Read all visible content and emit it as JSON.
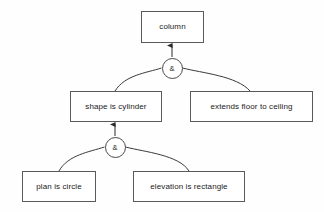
{
  "diagram": {
    "colors": {
      "background": "#fefefe",
      "box_fill": "#ffffff",
      "box_border": "#5a5a5a",
      "edge": "#3a3a3a",
      "text": "#1a1a1a"
    },
    "nodes": [
      {
        "id": "column",
        "label": "column",
        "x": 141,
        "y": 11,
        "width": 63,
        "height": 32
      },
      {
        "id": "shape-is-cylinder",
        "label": "shape is cylinder",
        "x": 70,
        "y": 91,
        "width": 92,
        "height": 31
      },
      {
        "id": "extends-floor-to-ceiling",
        "label": "extends floor to ceiling",
        "x": 190,
        "y": 91,
        "width": 123,
        "height": 31
      },
      {
        "id": "plan-is-circle",
        "label": "plan is circle",
        "x": 22,
        "y": 171,
        "width": 74,
        "height": 31
      },
      {
        "id": "elevation-is-rectangle",
        "label": "elevation is rectangle",
        "x": 133,
        "y": 171,
        "width": 112,
        "height": 31
      }
    ],
    "gates": [
      {
        "id": "and-gate-upper",
        "label": "&",
        "cx": 172,
        "cy": 68,
        "parent": "column",
        "children": [
          "shape-is-cylinder",
          "extends-floor-to-ceiling"
        ]
      },
      {
        "id": "and-gate-lower",
        "label": "&",
        "cx": 115,
        "cy": 147,
        "parent": "shape-is-cylinder",
        "children": [
          "plan-is-circle",
          "elevation-is-rectangle"
        ]
      }
    ]
  }
}
